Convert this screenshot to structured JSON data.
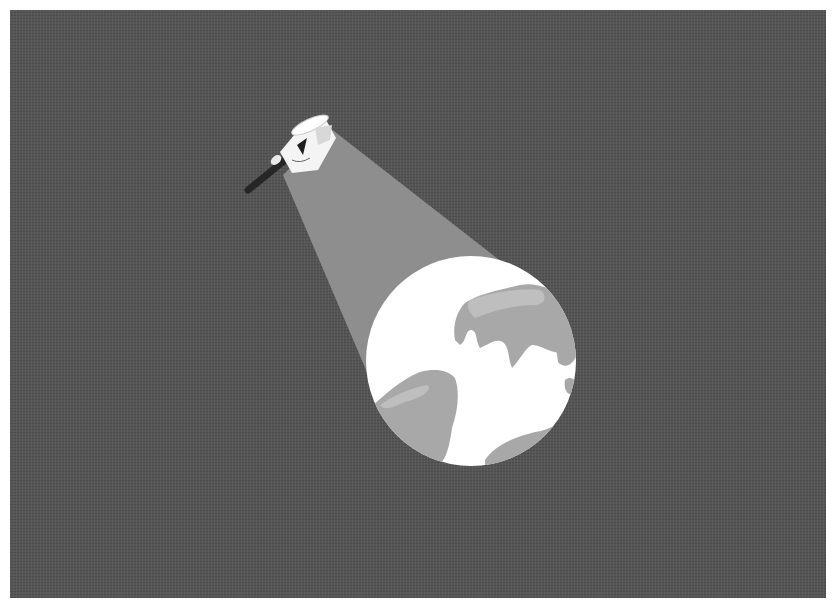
{
  "illustration": {
    "subject": "Flashlight beam illuminating Earth globe",
    "elements": [
      "flashlight",
      "light-beam",
      "earth-globe"
    ],
    "colors": {
      "background": "#555555",
      "border": "#ffffff",
      "beam": "#8c8c8c",
      "globe_ocean": "#ffffff",
      "globe_land": "#a6a6a6",
      "flashlight_body": "#f2f2f2",
      "flashlight_shadow": "#2a2a2a"
    }
  }
}
